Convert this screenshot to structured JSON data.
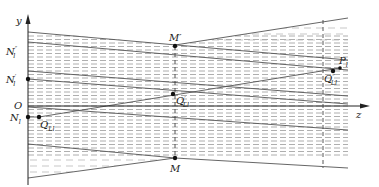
{
  "figure": {
    "type": "geometric-optics-diagram",
    "axes": {
      "vertical_label": "y",
      "horizontal_label": "z",
      "origin_label": "O"
    },
    "points": [
      {
        "id": "N_l_double_prime",
        "main": "N",
        "sub": "l",
        "sup": "″",
        "x": 28,
        "y": 51,
        "marked": false
      },
      {
        "id": "N_l_prime",
        "main": "N",
        "sub": "l",
        "sup": "′",
        "x": 28,
        "y": 79,
        "marked": true
      },
      {
        "id": "N_l",
        "main": "N",
        "sub": "l",
        "sup": "",
        "x": 28,
        "y": 117,
        "marked": true
      },
      {
        "id": "Q_Ll",
        "main": "Q",
        "sub": "Ll",
        "sup": "",
        "x": 39,
        "y": 117,
        "marked": true
      },
      {
        "id": "Q_Ll_prime",
        "main": "Q",
        "sub": "Ll",
        "sup": "′",
        "x": 173,
        "y": 93,
        "marked": true
      },
      {
        "id": "M_prime",
        "main": "M",
        "sub": "",
        "sup": "′",
        "x": 175,
        "y": 46,
        "marked": true
      },
      {
        "id": "M",
        "main": "M",
        "sub": "",
        "sup": "",
        "x": 175,
        "y": 158,
        "marked": true
      },
      {
        "id": "P_l",
        "main": "P",
        "sub": "l",
        "sup": "",
        "x": 340,
        "y": 70,
        "marked": true
      },
      {
        "id": "Q_Ll_double_prime",
        "main": "Q",
        "sub": "Ll",
        "sup": "″",
        "x": 333,
        "y": 71,
        "marked": true
      }
    ],
    "labels": {
      "y_axis": "y",
      "z_axis": "z",
      "origin": "O",
      "M_prime": "M′",
      "M": "M",
      "N_ldd_main": "N",
      "N_ldd_sup": "″",
      "N_ldd_sub": "l",
      "N_lp_main": "N",
      "N_lp_sup": "′",
      "N_lp_sub": "l",
      "N_l_main": "N",
      "N_l_sub": "l",
      "Q_Ll_main": "Q",
      "Q_Ll_sub": "Ll",
      "Q_Llp_main": "Q",
      "Q_Llp_sub": "Ll",
      "Q_Llp_sup": "′",
      "Q_Lldd_main": "Q",
      "Q_Lldd_sub": "Ll",
      "Q_Lldd_sup": "″",
      "P_l_main": "P",
      "P_l_sub": "l"
    },
    "colors": {
      "ink": "#222222",
      "solid_line": "#555555",
      "dashed_fill": "#9a9a9a",
      "background": "#ffffff"
    }
  }
}
